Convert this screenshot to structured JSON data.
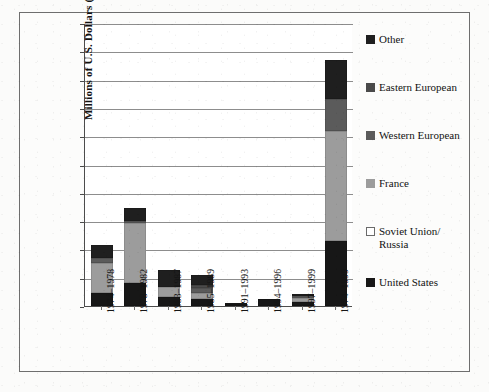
{
  "chart_data": {
    "type": "bar",
    "subtype": "stacked-vertical",
    "title": "",
    "xlabel": "",
    "ylabel": "Millions of U.S. Dollars (2004)",
    "ylim": [
      0,
      10000
    ],
    "ytick_interval": 1000,
    "grid": true,
    "legend_position": "right",
    "ytick_labels": [
      "10,000",
      "9,000",
      "8,000",
      "7,000",
      "6,000",
      "5,000",
      "4,000",
      "3,000",
      "2,000",
      "1,000",
      "0"
    ],
    "ytick_values": [
      10000,
      9000,
      8000,
      7000,
      6000,
      5000,
      4000,
      3000,
      2000,
      1000,
      0
    ],
    "categories": [
      "1974–1978",
      "1978–1982",
      "1983–1987",
      "1985–1989",
      "1991–1993",
      "1994–1996",
      "1997–1999",
      "1974–1999"
    ],
    "series": [
      {
        "name": "United States",
        "color": "#171717",
        "values": [
          450,
          800,
          330,
          250,
          60,
          235,
          150,
          2300
        ]
      },
      {
        "name": "Soviet Union/Russia",
        "color": "#ffffff",
        "values": [
          0,
          0,
          0,
          0,
          0,
          0,
          0,
          0
        ]
      },
      {
        "name": "France",
        "color": "#9c9c9c",
        "values": [
          1080,
          2150,
          330,
          220,
          0,
          0,
          120,
          3900
        ]
      },
      {
        "name": "Western European",
        "color": "#5b5b5b",
        "values": [
          180,
          70,
          0,
          150,
          0,
          0,
          90,
          1100
        ]
      },
      {
        "name": "Eastern European",
        "color": "#4a4a4a",
        "values": [
          0,
          0,
          0,
          110,
          0,
          0,
          0,
          0
        ]
      },
      {
        "name": "Other",
        "color": "#1f1f1f",
        "values": [
          440,
          430,
          610,
          370,
          60,
          0,
          80,
          1400
        ]
      }
    ],
    "totals": [
      2150,
      3450,
      1270,
      1100,
      120,
      235,
      440,
      8700
    ]
  },
  "legend": {
    "items": [
      {
        "label": "Other",
        "color": "#1f1f1f",
        "border": "#1f1f1f"
      },
      {
        "label": "Eastern European",
        "color": "#4a4a4a",
        "border": "#4a4a4a"
      },
      {
        "label": "Western European",
        "color": "#5b5b5b",
        "border": "#5b5b5b"
      },
      {
        "label": "France",
        "color": "#9c9c9c",
        "border": "#9c9c9c"
      },
      {
        "label": "Soviet Union/\nRussia",
        "color": "#ffffff",
        "border": "#6a6a6a"
      },
      {
        "label": "United States",
        "color": "#171717",
        "border": "#171717"
      }
    ]
  }
}
